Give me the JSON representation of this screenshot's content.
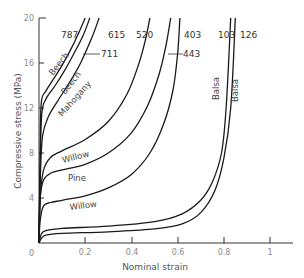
{
  "chart_data": {
    "type": "line",
    "title": "",
    "xlabel": "Nominal strain",
    "ylabel": "Compressive stress (MPa)",
    "xlim": [
      0,
      1.1
    ],
    "ylim": [
      0,
      20
    ],
    "x_ticks": [
      0,
      0.2,
      0.4,
      0.6,
      0.8,
      1
    ],
    "x_tick_labels": [
      "0",
      "0.2",
      "0.4",
      "0.6",
      "0.8",
      "1"
    ],
    "y_ticks": [
      0,
      4,
      8,
      12,
      16,
      20
    ],
    "y_tick_labels": [
      "0",
      "4",
      "8",
      "12",
      "16",
      "20"
    ],
    "grid": false,
    "legend": "none (curves labelled directly with density and species)",
    "series": [
      {
        "name": "Beech 787",
        "species": "Beech",
        "density_label": "787",
        "x": [
          0,
          0.005,
          0.01,
          0.03,
          0.06,
          0.1,
          0.14,
          0.17,
          0.2
        ],
        "y": [
          0,
          8,
          12.5,
          13.5,
          14.5,
          15.8,
          17.3,
          18.6,
          20
        ]
      },
      {
        "name": "Beech 615",
        "species": "Beech",
        "density_label": "615",
        "x": [
          0,
          0.005,
          0.012,
          0.03,
          0.07,
          0.11,
          0.15,
          0.19,
          0.22
        ],
        "y": [
          0,
          7,
          11.5,
          12.8,
          14,
          15.3,
          16.8,
          18.4,
          20
        ]
      },
      {
        "name": "Mahogany 711",
        "species": "Mahogany",
        "density_label": "711",
        "x": [
          0,
          0.006,
          0.015,
          0.04,
          0.08,
          0.13,
          0.18,
          0.23,
          0.26
        ],
        "y": [
          0,
          6,
          9.5,
          11.2,
          12.6,
          14.2,
          16,
          18.3,
          20
        ]
      },
      {
        "name": "Willow 520",
        "species": "Willow",
        "density_label": "520",
        "x": [
          0,
          0.005,
          0.02,
          0.05,
          0.1,
          0.2,
          0.3,
          0.38,
          0.43,
          0.46,
          0.48
        ],
        "y": [
          0,
          4,
          6.5,
          7.6,
          8.2,
          9.2,
          10.8,
          13.2,
          15.8,
          18,
          20
        ]
      },
      {
        "name": "Pine 403",
        "species": "Pine",
        "density_label": "403",
        "x": [
          0,
          0.005,
          0.02,
          0.05,
          0.1,
          0.2,
          0.3,
          0.4,
          0.47,
          0.52,
          0.55,
          0.57
        ],
        "y": [
          0,
          4,
          5.6,
          6.2,
          6.5,
          7,
          8,
          9.8,
          12.2,
          15,
          17.6,
          20
        ]
      },
      {
        "name": "Willow 443",
        "species": "Willow",
        "density_label": "443",
        "x": [
          0,
          0.005,
          0.02,
          0.05,
          0.1,
          0.2,
          0.3,
          0.4,
          0.48,
          0.54,
          0.58,
          0.6,
          0.61
        ],
        "y": [
          0,
          2,
          3.3,
          3.6,
          3.8,
          4.2,
          4.9,
          6.1,
          8,
          10.6,
          13.6,
          16.8,
          20
        ]
      },
      {
        "name": "Balsa 103",
        "species": "Balsa",
        "density_label": "103",
        "x": [
          0,
          0.01,
          0.03,
          0.1,
          0.3,
          0.5,
          0.62,
          0.7,
          0.75,
          0.79,
          0.81,
          0.83
        ],
        "y": [
          0,
          0.8,
          1.1,
          1.3,
          1.5,
          1.9,
          2.6,
          3.8,
          5.4,
          8,
          12,
          20
        ]
      },
      {
        "name": "Balsa 126",
        "species": "Balsa",
        "density_label": "126",
        "x": [
          0,
          0.01,
          0.03,
          0.1,
          0.3,
          0.5,
          0.62,
          0.7,
          0.76,
          0.8,
          0.83,
          0.85
        ],
        "y": [
          0,
          0.4,
          0.7,
          0.85,
          1.0,
          1.25,
          1.7,
          2.7,
          4.6,
          7.5,
          12,
          20
        ]
      }
    ],
    "annotations": [
      {
        "text": "787",
        "target": "Beech 787"
      },
      {
        "text": "615",
        "target": "Beech 615"
      },
      {
        "text": "711",
        "target": "Mahogany 711"
      },
      {
        "text": "520",
        "target": "Willow 520"
      },
      {
        "text": "403",
        "target": "Pine 403"
      },
      {
        "text": "443",
        "target": "Willow 443"
      },
      {
        "text": "103",
        "target": "Balsa 103"
      },
      {
        "text": "126",
        "target": "Balsa 126"
      },
      {
        "text": "Beech",
        "target": "Beech 787"
      },
      {
        "text": "Beech",
        "target": "Beech 615"
      },
      {
        "text": "Mahogany",
        "target": "Mahogany 711"
      },
      {
        "text": "Willow",
        "target": "Willow 520"
      },
      {
        "text": "Pine",
        "target": "Pine 403"
      },
      {
        "text": "Willow",
        "target": "Willow 443"
      },
      {
        "text": "Balsa",
        "target": "Balsa 103"
      },
      {
        "text": "Balsa",
        "target": "Balsa 126"
      }
    ]
  },
  "labels": {
    "xlabel": "Nominal strain",
    "ylabel": "Compressive stress (MPa)",
    "density": {
      "d787": "787",
      "d615": "615",
      "d711": "711",
      "d520": "520",
      "d403": "403",
      "d443": "443",
      "d103": "103",
      "d126": "126"
    },
    "species": {
      "beech1": "Beech",
      "beech2": "Beech",
      "mahogany": "Mahogany",
      "willow1": "Willow",
      "pine": "Pine",
      "willow2": "Willow",
      "balsa1": "Balsa",
      "balsa2": "Balsa"
    },
    "xticks": [
      "0",
      "0.2",
      "0.4",
      "0.6",
      "0.8",
      "1"
    ],
    "yticks": [
      "0",
      "4",
      "8",
      "12",
      "16",
      "20"
    ]
  }
}
